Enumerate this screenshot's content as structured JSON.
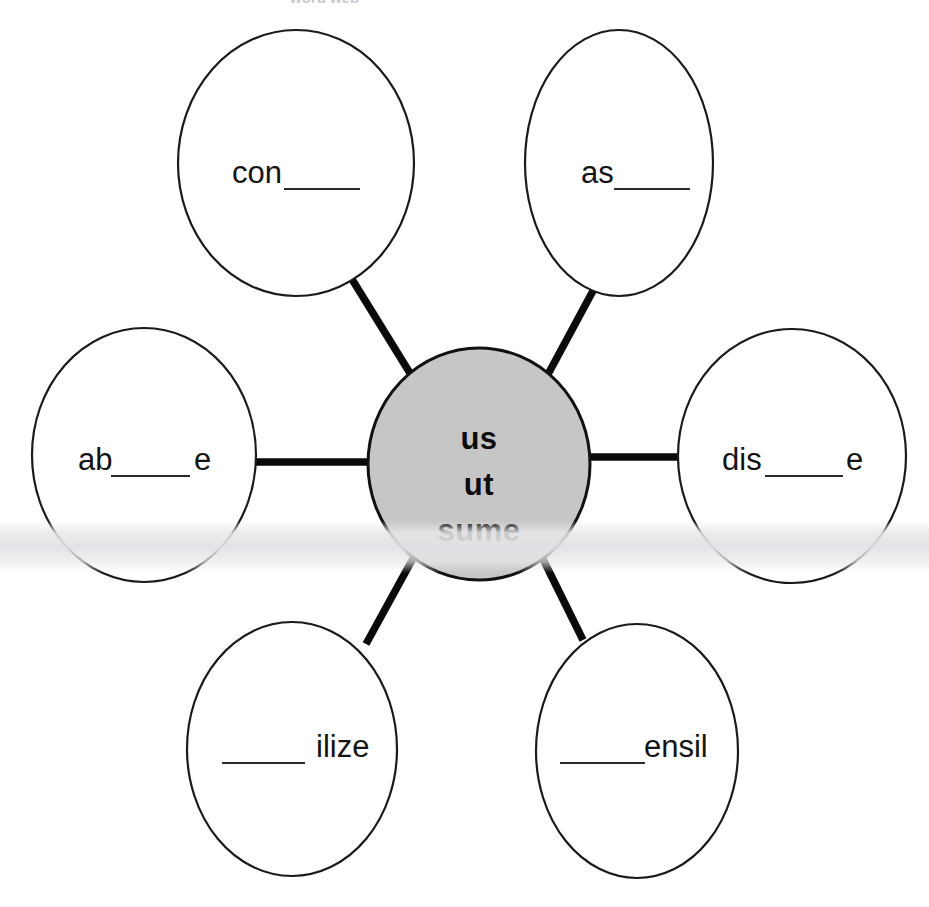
{
  "diagram": {
    "type": "word-web",
    "title_fragment": "word web",
    "center": {
      "id": "center-node",
      "lines": [
        "us",
        "ut",
        "sume"
      ],
      "fill_color": "#c6c6c6",
      "stroke_color": "#111111",
      "shape": "ellipse"
    },
    "nodes": [
      {
        "id": "node-top-left",
        "position": "top-left",
        "prefix": "con",
        "blank": "______",
        "suffix": "",
        "text": "con______",
        "fill_color": "#ffffff",
        "stroke_color": "#1a1a1a"
      },
      {
        "id": "node-top-right",
        "position": "top-right",
        "prefix": "as",
        "blank": "______",
        "suffix": "",
        "text": "as______",
        "fill_color": "#ffffff",
        "stroke_color": "#1a1a1a"
      },
      {
        "id": "node-middle-left",
        "position": "middle-left",
        "prefix": "ab",
        "blank": "______",
        "suffix": "e",
        "text": "ab______e",
        "fill_color": "#ffffff",
        "stroke_color": "#1a1a1a"
      },
      {
        "id": "node-middle-right",
        "position": "middle-right",
        "prefix": "dis",
        "blank": "______",
        "suffix": "e",
        "text": "dis______e",
        "fill_color": "#ffffff",
        "stroke_color": "#1a1a1a"
      },
      {
        "id": "node-bottom-left",
        "position": "bottom-left",
        "prefix": "",
        "blank": "______",
        "suffix": " ilize",
        "text": "______ ilize",
        "fill_color": "#ffffff",
        "stroke_color": "#1a1a1a"
      },
      {
        "id": "node-bottom-right",
        "position": "bottom-right",
        "prefix": "",
        "blank": "______",
        "suffix": "ensil",
        "text": "______ensil",
        "fill_color": "#ffffff",
        "stroke_color": "#1a1a1a"
      }
    ],
    "connectors": [
      {
        "id": "spoke-top-left",
        "from": "center-node",
        "to": "node-top-left"
      },
      {
        "id": "spoke-top-right",
        "from": "center-node",
        "to": "node-top-right"
      },
      {
        "id": "spoke-middle-left",
        "from": "center-node",
        "to": "node-middle-left"
      },
      {
        "id": "spoke-middle-right",
        "from": "center-node",
        "to": "node-middle-right"
      },
      {
        "id": "spoke-bottom-left",
        "from": "center-node",
        "to": "node-bottom-left"
      },
      {
        "id": "spoke-bottom-right",
        "from": "center-node",
        "to": "node-bottom-right"
      }
    ],
    "colors": {
      "page_background": "#ffffff",
      "center_fill": "#c6c6c6",
      "node_fill": "#ffffff",
      "outline": "#1a1a1a",
      "connector": "#0a0a0a",
      "text": "#141414"
    }
  }
}
